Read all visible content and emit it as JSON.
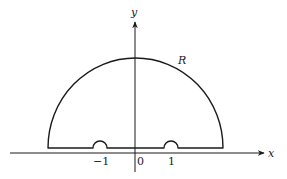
{
  "diagram": {
    "axes": {
      "x_label": "x",
      "y_label": "y"
    },
    "contour_label": "R",
    "tick_labels": {
      "neg_one": "−1",
      "zero": "0",
      "one": "1"
    },
    "colors": {
      "stroke": "#1a1a1a",
      "background": "#ffffff"
    }
  }
}
